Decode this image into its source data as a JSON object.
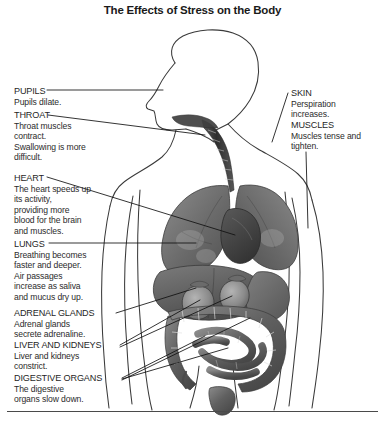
{
  "title": "The Effects of Stress on the Body",
  "figure": {
    "alt_name": "human-torso-anatomy",
    "view": "male figure, head in left profile, torso with internal organs",
    "organs": [
      "trachea",
      "lungs",
      "heart",
      "liver",
      "kidneys",
      "stomach",
      "large intestine",
      "small intestine"
    ]
  },
  "labels": {
    "left": [
      {
        "id": "pupils",
        "head": "PUPILS",
        "lines": [
          "Pupils dilate."
        ]
      },
      {
        "id": "throat",
        "head": "THROAT",
        "lines": [
          "Throat muscles",
          "contract.",
          "Swallowing is more",
          "difficult."
        ]
      },
      {
        "id": "heart",
        "head": "HEART",
        "lines": [
          "The heart speeds up",
          "its activity,",
          "providing more",
          "blood for the brain",
          "and muscles."
        ]
      },
      {
        "id": "lungs",
        "head": "LUNGS",
        "lines": [
          "Breathing becomes",
          "faster and deeper.",
          "Air passages",
          "increase as saliva",
          "and mucus dry up."
        ]
      },
      {
        "id": "adrenal-glands",
        "head": "ADRENAL GLANDS",
        "lines": [
          "Adrenal glands",
          "secrete adrenaline."
        ]
      },
      {
        "id": "liver-and-kidneys",
        "head": "LIVER AND KIDNEYS",
        "lines": [
          "Liver and kidneys",
          "constrict."
        ]
      },
      {
        "id": "digestive-organs",
        "head": "DIGESTIVE ORGANS",
        "lines": [
          "The digestive",
          "organs slow down."
        ]
      }
    ],
    "right": [
      {
        "id": "skin",
        "head": "SKIN",
        "lines": [
          "Perspiration",
          "increases."
        ]
      },
      {
        "id": "muscles",
        "head": "MUSCLES",
        "lines": [
          "Muscles tense and",
          "tighten."
        ]
      }
    ]
  },
  "colors": {
    "background": "#ffffff",
    "text": "#2b2b2b",
    "title": "#1a1a1a",
    "outline": "#3a3a3a",
    "leader_line": "#111111",
    "organ_dark": "#4a4a4a",
    "organ_mid": "#6e6e6e",
    "organ_light": "#9a9a9a",
    "rule": "#4a4a4a"
  }
}
